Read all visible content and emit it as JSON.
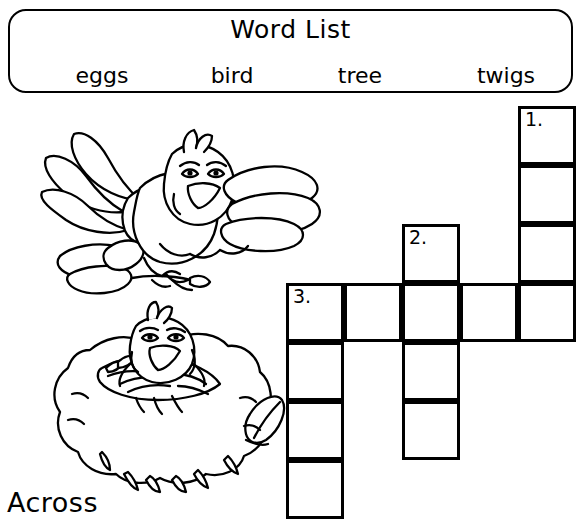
{
  "worksheet": {
    "wordlist": {
      "title": "Word List",
      "words": [
        "eggs",
        "bird",
        "tree",
        "twigs"
      ]
    },
    "across_label": "Across",
    "crossword": {
      "cell_size": 58,
      "numbers": {
        "one": "1.",
        "two": "2.",
        "three": "3."
      },
      "entries": [
        {
          "number": "1.",
          "direction": "down",
          "length": 4,
          "start_col": 5,
          "start_row": 1
        },
        {
          "number": "2.",
          "direction": "down",
          "length": 4,
          "start_col": 3,
          "start_row": 3
        },
        {
          "number": "3.",
          "direction": "across",
          "length": 5,
          "start_col": 1,
          "start_row": 4
        },
        {
          "number": "3.",
          "direction": "down",
          "length": 4,
          "start_col": 1,
          "start_row": 4
        }
      ],
      "cells": [
        {
          "name": "cell-c5-r1",
          "x": 518,
          "y": 106,
          "number": "1."
        },
        {
          "name": "cell-c5-r2",
          "x": 518,
          "y": 165,
          "number": ""
        },
        {
          "name": "cell-c5-r3",
          "x": 518,
          "y": 224,
          "number": ""
        },
        {
          "name": "cell-c5-r4",
          "x": 518,
          "y": 283,
          "number": ""
        },
        {
          "name": "cell-c3-r3",
          "x": 402,
          "y": 224,
          "number": "2."
        },
        {
          "name": "cell-c3-r4",
          "x": 402,
          "y": 283,
          "number": ""
        },
        {
          "name": "cell-c3-r5",
          "x": 402,
          "y": 342,
          "number": ""
        },
        {
          "name": "cell-c3-r6",
          "x": 402,
          "y": 401,
          "number": ""
        },
        {
          "name": "cell-c1-r4",
          "x": 286,
          "y": 283,
          "number": "3."
        },
        {
          "name": "cell-c2-r4",
          "x": 344,
          "y": 283,
          "number": ""
        },
        {
          "name": "cell-c4-r4",
          "x": 460,
          "y": 283,
          "number": ""
        },
        {
          "name": "cell-c1-r5",
          "x": 286,
          "y": 342,
          "number": ""
        },
        {
          "name": "cell-c1-r6",
          "x": 286,
          "y": 401,
          "number": ""
        },
        {
          "name": "cell-c1-r7",
          "x": 286,
          "y": 460,
          "number": ""
        }
      ]
    },
    "illustrations": [
      {
        "name": "flying-bird-illustration",
        "description": "bird flying with twigs in its claws"
      },
      {
        "name": "nest-bird-illustration",
        "description": "bird sitting in a nest"
      }
    ]
  }
}
